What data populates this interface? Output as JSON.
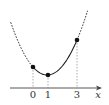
{
  "diagram": {
    "axis": {
      "label": "x",
      "ticks": [
        "0",
        "1",
        "3"
      ]
    },
    "points": [
      {
        "x_label": "0"
      },
      {
        "x_label": "1"
      },
      {
        "x_label": "3"
      }
    ],
    "colors": {
      "curve": "#222222",
      "axis": "#444444",
      "guide": "#888888"
    }
  }
}
